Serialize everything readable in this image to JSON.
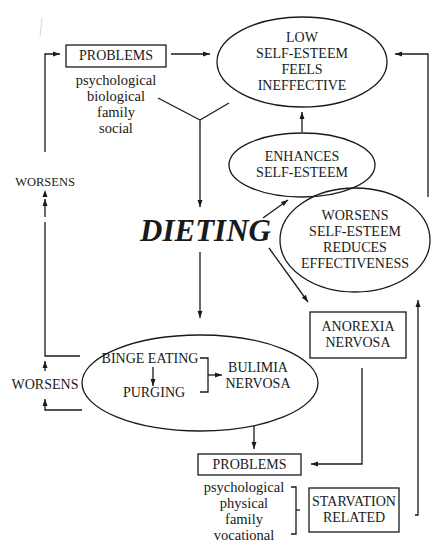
{
  "diagram": {
    "type": "flowchart",
    "colors": {
      "line": "#1a1a1a",
      "background": "#ffffff"
    },
    "nodes": {
      "problems_top": {
        "title": "PROBLEMS",
        "items": [
          "psychological",
          "biological",
          "family",
          "social"
        ]
      },
      "low_self_esteem": {
        "lines": [
          "LOW",
          "SELF-ESTEEM",
          "FEELS",
          "INEFFECTIVE"
        ]
      },
      "enhances": {
        "lines": [
          "ENHANCES",
          "SELF-ESTEEM"
        ]
      },
      "dieting": {
        "label": "DIETING"
      },
      "worsens_self_esteem": {
        "lines": [
          "WORSENS",
          "SELF-ESTEEM",
          "REDUCES",
          "EFFECTIVENESS"
        ]
      },
      "anorexia": {
        "lines": [
          "ANOREXIA",
          "NERVOSA"
        ]
      },
      "bulimia_cycle": {
        "binge": "BINGE EATING",
        "purging": "PURGING",
        "outcome": [
          "BULIMIA",
          "NERVOSA"
        ]
      },
      "problems_bottom": {
        "title": "PROBLEMS",
        "items": [
          "psychological",
          "physical",
          "family",
          "vocational"
        ]
      },
      "starvation": {
        "lines": [
          "STARVATION",
          "RELATED"
        ]
      },
      "worsens_left_upper": {
        "label": "WORSENS"
      },
      "worsens_left_lower": {
        "label": "WORSENS"
      }
    },
    "edges": [
      {
        "from": "problems_top",
        "to": "low_self_esteem"
      },
      {
        "from": "problems_top+low_self_esteem",
        "to": "dieting"
      },
      {
        "from": "dieting",
        "to": "enhances"
      },
      {
        "from": "enhances",
        "to": "low_self_esteem"
      },
      {
        "from": "dieting",
        "to": "anorexia"
      },
      {
        "from": "dieting",
        "to": "bulimia_cycle"
      },
      {
        "from": "bulimia_cycle",
        "to": "problems_top",
        "label": "WORSENS"
      },
      {
        "from": "bulimia_cycle",
        "to": "bulimia_cycle",
        "label": "WORSENS"
      },
      {
        "from": "bulimia_cycle",
        "to": "problems_bottom"
      },
      {
        "from": "anorexia",
        "to": "problems_bottom"
      },
      {
        "from": "worsens_self_esteem",
        "to": "low_self_esteem"
      },
      {
        "from": "starvation",
        "to": "worsens_self_esteem"
      }
    ]
  }
}
